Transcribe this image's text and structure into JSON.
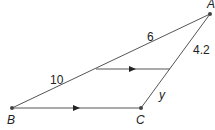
{
  "diagram": {
    "points": {
      "A": {
        "label": "A",
        "x": 210,
        "y": 14
      },
      "B": {
        "label": "B",
        "x": 12,
        "y": 108
      },
      "C": {
        "label": "C",
        "x": 141,
        "y": 108
      }
    },
    "parallel_segment": {
      "x1": 96,
      "y1": 69,
      "x2": 170,
      "y2": 69
    },
    "measurements": {
      "top_segment_AB": "6",
      "bottom_segment_AB": "10",
      "top_segment_AC": "4.2",
      "bottom_segment_AC": "y"
    },
    "colors": {
      "line": "#555555",
      "point": "#444444",
      "text": "#222222"
    }
  }
}
